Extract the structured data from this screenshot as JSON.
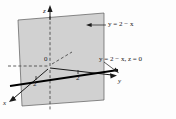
{
  "figure": {
    "colors": {
      "plane_fill": "#c9c9c9",
      "plane_edge": "#4a4a4a",
      "axis": "#1a1a1a",
      "trace_line": "#000000",
      "background": "#fdfdfd",
      "text": "#1a1a1a"
    },
    "plane": {
      "name": "shaded-plane",
      "equation": "y = 2 - x"
    },
    "axes": [
      {
        "name": "x-axis",
        "label": "x"
      },
      {
        "name": "y-axis",
        "label": "y"
      },
      {
        "name": "z-axis",
        "label": "z"
      }
    ],
    "origin_label": "0",
    "ticks": [
      {
        "axis": "x",
        "label": "2"
      },
      {
        "axis": "y",
        "label": "2"
      }
    ],
    "annotations": [
      {
        "name": "plane-equation-label",
        "text": "y = 2 − x",
        "target": "shaded-plane"
      },
      {
        "name": "trace-equation-label",
        "text": "y = 2 − x, z = 0",
        "target": "trace-line"
      }
    ]
  }
}
